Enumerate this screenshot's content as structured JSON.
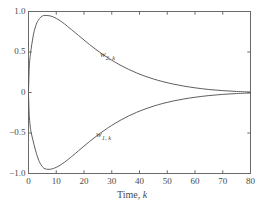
{
  "chart_data": {
    "type": "line",
    "title": "",
    "xlabel": "Time, k",
    "ylabel": "",
    "xlim": [
      0,
      80
    ],
    "ylim": [
      -1.0,
      1.0
    ],
    "xticks": [
      0,
      10,
      20,
      30,
      40,
      50,
      60,
      70,
      80
    ],
    "xticklabels": [
      "0",
      "10",
      "20",
      "30",
      "40",
      "50",
      "60",
      "70",
      "80"
    ],
    "yticks": [
      -1.0,
      -0.5,
      0,
      0.5,
      1.0
    ],
    "yticklabels": [
      "-1.0",
      "-0.5",
      "0",
      "0.5",
      "1.0"
    ],
    "grid": false,
    "legend_position": "inline-annotation",
    "line_color": "#555555",
    "axis_color": "#6a6a6a",
    "annotations": [
      {
        "text": "w",
        "sub": "2, k",
        "x_px": 100,
        "y_px": 49
      },
      {
        "text": "w",
        "sub": "1, k",
        "x_px": 96,
        "y_px": 129
      }
    ],
    "series": [
      {
        "name": "w_2,k",
        "label": "w",
        "label_sub": "2, k",
        "x": [
          0,
          0.3,
          0.7,
          1,
          1.5,
          2,
          2.5,
          3,
          3.5,
          4,
          5,
          6,
          7,
          8,
          9,
          10,
          11,
          12,
          13,
          14,
          15,
          16,
          18,
          20,
          22,
          24,
          26,
          28,
          30,
          33,
          36,
          39,
          42,
          45,
          48,
          52,
          56,
          60,
          65,
          70,
          75,
          80
        ],
        "y": [
          0.02,
          0.33,
          0.47,
          0.55,
          0.66,
          0.75,
          0.81,
          0.86,
          0.89,
          0.915,
          0.945,
          0.952,
          0.95,
          0.944,
          0.932,
          0.915,
          0.895,
          0.872,
          0.846,
          0.818,
          0.79,
          0.762,
          0.705,
          0.648,
          0.592,
          0.539,
          0.489,
          0.442,
          0.399,
          0.339,
          0.287,
          0.241,
          0.201,
          0.167,
          0.138,
          0.105,
          0.079,
          0.058,
          0.037,
          0.023,
          0.013,
          0.006
        ]
      },
      {
        "name": "w_1,k",
        "label": "w",
        "label_sub": "1, k",
        "x": [
          0,
          0.3,
          0.7,
          1,
          1.5,
          2,
          2.5,
          3,
          3.5,
          4,
          5,
          6,
          7,
          8,
          9,
          10,
          11,
          12,
          13,
          14,
          15,
          16,
          18,
          20,
          22,
          24,
          26,
          28,
          30,
          33,
          36,
          39,
          42,
          45,
          48,
          52,
          56,
          60,
          65,
          70,
          75,
          80
        ],
        "y": [
          -0.02,
          -0.3,
          -0.44,
          -0.5,
          -0.575,
          -0.645,
          -0.71,
          -0.77,
          -0.82,
          -0.862,
          -0.917,
          -0.942,
          -0.949,
          -0.947,
          -0.938,
          -0.924,
          -0.906,
          -0.884,
          -0.86,
          -0.834,
          -0.806,
          -0.778,
          -0.72,
          -0.662,
          -0.605,
          -0.551,
          -0.499,
          -0.451,
          -0.406,
          -0.345,
          -0.291,
          -0.244,
          -0.204,
          -0.169,
          -0.139,
          -0.106,
          -0.08,
          -0.059,
          -0.038,
          -0.023,
          -0.013,
          -0.006
        ]
      }
    ]
  },
  "axes": {
    "x_title": "Time, ",
    "x_title_italic": "k"
  }
}
